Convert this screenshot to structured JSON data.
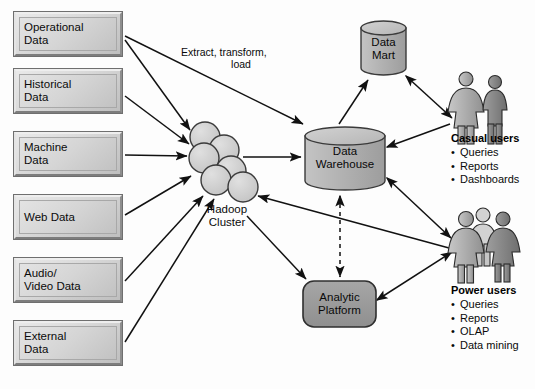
{
  "diagram": {
    "colors": {
      "box_fill_light": "#e3e3e3",
      "box_fill_dark": "#c2c2c2",
      "cylinder_fill": "#b0b0b0",
      "cylinder_top": "#c6c6c6",
      "platform_fill": "#9a9a9a",
      "node_fill": "#d0d0d0",
      "stroke": "#1a1a1a",
      "background": "#ffffff"
    },
    "sources": [
      {
        "id": "operational",
        "label": "Operational\nData",
        "x": 13,
        "y": 11,
        "w": 110,
        "h": 46
      },
      {
        "id": "historical",
        "label": "Historical\nData",
        "x": 13,
        "y": 68,
        "w": 110,
        "h": 46
      },
      {
        "id": "machine",
        "label": "Machine\nData",
        "x": 13,
        "y": 131,
        "w": 110,
        "h": 46
      },
      {
        "id": "web",
        "label": "Web Data",
        "x": 13,
        "y": 194,
        "w": 110,
        "h": 46
      },
      {
        "id": "audio_video",
        "label": "Audio/\nVideo Data",
        "x": 13,
        "y": 257,
        "w": 110,
        "h": 46
      },
      {
        "id": "external",
        "label": "External\nData",
        "x": 13,
        "y": 320,
        "w": 110,
        "h": 46
      }
    ],
    "hadoop": {
      "label": "Hadoop\nCluster",
      "label_x": 212,
      "label_y": 205,
      "nodes": [
        {
          "cx": 205,
          "cy": 137,
          "r": 15
        },
        {
          "cx": 224,
          "cy": 150,
          "r": 15
        },
        {
          "cx": 205,
          "cy": 158,
          "r": 15
        },
        {
          "cx": 229,
          "cy": 172,
          "r": 15
        },
        {
          "cx": 219,
          "cy": 179,
          "r": 15
        },
        {
          "cx": 243,
          "cy": 186,
          "r": 15
        }
      ]
    },
    "warehouse": {
      "label": "Data\nWarehouse",
      "x": 305,
      "y": 127,
      "w": 80,
      "h": 63
    },
    "mart": {
      "label": "Data\nMart",
      "x": 361,
      "y": 21,
      "w": 45,
      "h": 54
    },
    "platform": {
      "label": "Analytic\nPlatform",
      "x": 303,
      "y": 281,
      "w": 72,
      "h": 46
    },
    "etl_label": {
      "line1": "Extract, transform,",
      "line2": "load",
      "x": 181,
      "y": 52
    },
    "casual_users": {
      "title": "Casual users",
      "items": [
        "Queries",
        "Reports",
        "Dashboards"
      ],
      "x": 451,
      "y": 132,
      "figures": 2,
      "figure_x": 458,
      "figure_y": 72
    },
    "power_users": {
      "title": "Power users",
      "items": [
        "Queries",
        "Reports",
        "OLAP",
        "Data mining"
      ],
      "x": 451,
      "y": 284,
      "figures": 3,
      "figure_x": 452,
      "figure_y": 208
    },
    "connections": [
      {
        "from": "operational",
        "to": "hadoop",
        "type": "solid"
      },
      {
        "from": "operational",
        "to": "warehouse",
        "type": "solid"
      },
      {
        "from": "historical",
        "to": "hadoop",
        "type": "solid"
      },
      {
        "from": "machine",
        "to": "hadoop",
        "type": "solid"
      },
      {
        "from": "web",
        "to": "hadoop",
        "type": "solid"
      },
      {
        "from": "audio_video",
        "to": "hadoop",
        "type": "solid"
      },
      {
        "from": "external",
        "to": "hadoop",
        "type": "solid"
      },
      {
        "from": "hadoop",
        "to": "warehouse",
        "type": "solid"
      },
      {
        "from": "hadoop",
        "to": "platform",
        "type": "solid"
      },
      {
        "from": "hadoop",
        "to": "power_users",
        "type": "solid"
      },
      {
        "from": "warehouse",
        "to": "mart",
        "type": "solid"
      },
      {
        "from": "warehouse",
        "to": "casual_users",
        "type": "solid"
      },
      {
        "from": "warehouse",
        "to": "power_users",
        "type": "solid"
      },
      {
        "from": "warehouse",
        "to": "platform",
        "type": "dashed-bidirectional"
      },
      {
        "from": "mart",
        "to": "casual_users",
        "type": "bidirectional"
      },
      {
        "from": "platform",
        "to": "power_users",
        "type": "bidirectional"
      }
    ]
  }
}
